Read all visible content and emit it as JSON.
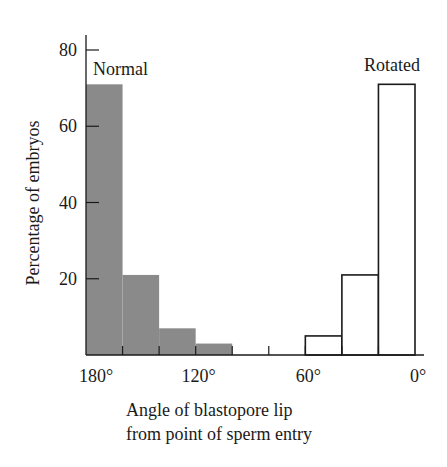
{
  "chart_data": {
    "type": "bar",
    "title": "",
    "xlabel": "Angle of blastopore lip from point of sperm entry",
    "xlabel_lines": [
      "Angle of blastopore lip",
      "from point of sperm entry"
    ],
    "ylabel": "Percentage of embryos",
    "ylim": [
      0,
      80
    ],
    "yticks": [
      20,
      40,
      60,
      80
    ],
    "xticks": [
      "180°",
      "120°",
      "60°",
      "0°"
    ],
    "xrange": [
      180,
      0
    ],
    "bin_width_deg": 20,
    "grid": false,
    "categories": [
      "180–160°",
      "160–140°",
      "140–120°",
      "120–100°",
      "100–80°",
      "80–60°",
      "60–40°",
      "40–20°",
      "20–0°"
    ],
    "series": [
      {
        "name": "Normal",
        "fill": "#8a8a8a",
        "style": "filled",
        "values": [
          71,
          21,
          7,
          3,
          0,
          0,
          0,
          0,
          0
        ]
      },
      {
        "name": "Rotated",
        "fill": "#ffffff",
        "style": "outline",
        "values": [
          0,
          0,
          0,
          0,
          0,
          0,
          5,
          21,
          71
        ]
      }
    ],
    "annotations": [
      {
        "text": "Normal",
        "position": "top-left"
      },
      {
        "text": "Rotated",
        "position": "top-right"
      }
    ]
  }
}
